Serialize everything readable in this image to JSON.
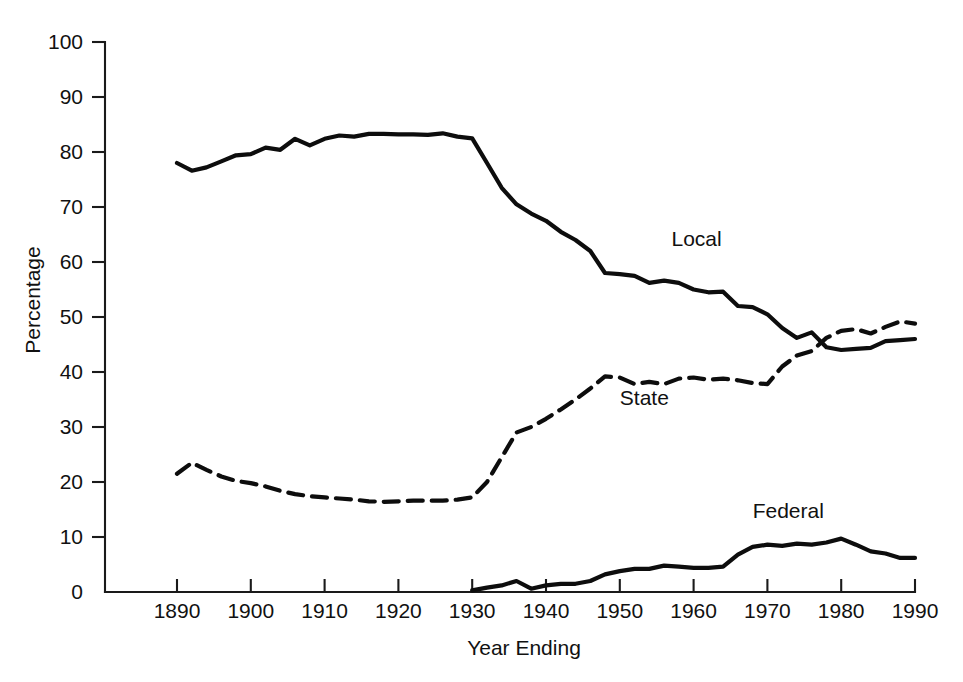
{
  "chart_data": {
    "type": "line",
    "title": "",
    "xlabel": "Year Ending",
    "ylabel": "Percentage",
    "xlim": [
      1882,
      1992
    ],
    "ylim": [
      0,
      100
    ],
    "grid": false,
    "legend_position": "inline-labels",
    "x_ticks": [
      1890,
      1900,
      1910,
      1920,
      1930,
      1940,
      1950,
      1960,
      1970,
      1980,
      1990
    ],
    "y_ticks": [
      0,
      10,
      20,
      30,
      40,
      50,
      60,
      70,
      80,
      90,
      100
    ],
    "series": [
      {
        "name": "Local",
        "style": "solid",
        "label_x": 1957,
        "label_y": 63,
        "x": [
          1890,
          1892,
          1894,
          1896,
          1898,
          1900,
          1902,
          1904,
          1906,
          1908,
          1910,
          1912,
          1914,
          1916,
          1918,
          1920,
          1922,
          1924,
          1926,
          1928,
          1930,
          1932,
          1934,
          1936,
          1938,
          1940,
          1942,
          1944,
          1946,
          1948,
          1950,
          1952,
          1954,
          1956,
          1958,
          1960,
          1962,
          1964,
          1966,
          1968,
          1970,
          1972,
          1974,
          1976,
          1978,
          1980,
          1982,
          1984,
          1986,
          1988,
          1990
        ],
        "y": [
          78.0,
          76.6,
          77.2,
          78.3,
          79.4,
          79.6,
          80.8,
          80.4,
          82.4,
          81.2,
          82.4,
          83.0,
          82.8,
          83.3,
          83.3,
          83.2,
          83.2,
          83.1,
          83.4,
          82.8,
          82.5,
          78.0,
          73.5,
          70.5,
          68.8,
          67.5,
          65.5,
          64.0,
          62.0,
          58.0,
          57.8,
          57.5,
          56.2,
          56.6,
          56.2,
          55.0,
          54.5,
          54.6,
          52.0,
          51.8,
          50.5,
          48.0,
          46.2,
          47.2,
          44.5,
          44.0,
          44.2,
          44.4,
          45.6,
          45.8,
          46.0
        ]
      },
      {
        "name": "State",
        "style": "dashed",
        "label_x": 1950,
        "label_y": 34,
        "x": [
          1890,
          1892,
          1894,
          1896,
          1898,
          1900,
          1902,
          1904,
          1906,
          1908,
          1910,
          1912,
          1914,
          1916,
          1918,
          1920,
          1922,
          1924,
          1926,
          1928,
          1930,
          1932,
          1934,
          1936,
          1938,
          1940,
          1942,
          1944,
          1946,
          1948,
          1950,
          1952,
          1954,
          1956,
          1958,
          1960,
          1962,
          1964,
          1966,
          1968,
          1970,
          1972,
          1974,
          1976,
          1978,
          1980,
          1982,
          1984,
          1986,
          1988,
          1990
        ],
        "y": [
          21.5,
          23.5,
          22.2,
          21.0,
          20.2,
          19.8,
          19.2,
          18.4,
          17.8,
          17.4,
          17.2,
          17.0,
          16.8,
          16.5,
          16.4,
          16.5,
          16.6,
          16.6,
          16.6,
          16.8,
          17.2,
          20.0,
          24.5,
          29.0,
          30.0,
          31.5,
          33.2,
          35.0,
          37.0,
          39.2,
          39.0,
          37.8,
          38.2,
          37.8,
          38.8,
          39.0,
          38.6,
          38.8,
          38.5,
          38.0,
          37.8,
          41.0,
          43.0,
          43.8,
          46.2,
          47.5,
          47.8,
          47.0,
          48.2,
          49.2,
          48.8
        ]
      },
      {
        "name": "Federal",
        "style": "solid",
        "label_x": 1968,
        "label_y": 13.5,
        "x": [
          1930,
          1932,
          1934,
          1936,
          1938,
          1940,
          1942,
          1944,
          1946,
          1948,
          1950,
          1952,
          1954,
          1956,
          1958,
          1960,
          1962,
          1964,
          1966,
          1968,
          1970,
          1972,
          1974,
          1976,
          1978,
          1980,
          1982,
          1984,
          1986,
          1988,
          1990
        ],
        "y": [
          0.3,
          0.8,
          1.2,
          2.0,
          0.6,
          1.2,
          1.5,
          1.5,
          2.0,
          3.2,
          3.8,
          4.2,
          4.2,
          4.8,
          4.6,
          4.4,
          4.4,
          4.6,
          6.8,
          8.2,
          8.6,
          8.4,
          8.8,
          8.6,
          9.0,
          9.7,
          8.6,
          7.4,
          7.0,
          6.2,
          6.2
        ]
      }
    ]
  }
}
